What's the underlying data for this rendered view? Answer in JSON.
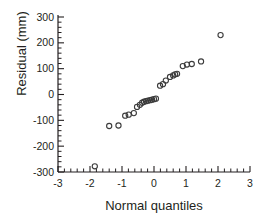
{
  "chart_data": {
    "type": "scatter",
    "title": "",
    "subtitle": "",
    "xlabel": "Normal quantiles",
    "ylabel": "Residual (mm)",
    "xlim": [
      -3,
      3
    ],
    "ylim": [
      -300,
      300
    ],
    "xticks": [
      -3,
      -2,
      -1,
      0,
      1,
      2,
      3
    ],
    "xtick_labels": [
      "-3",
      "-2",
      "-1",
      "0",
      "1",
      "2",
      "3"
    ],
    "yticks": [
      -300,
      -200,
      -100,
      0,
      100,
      200,
      300
    ],
    "ytick_labels": [
      "-300",
      "-200",
      "-100",
      "0",
      "100",
      "200",
      "300"
    ],
    "minor_ticks_per_interval": 4,
    "grid": false,
    "legend": null,
    "marker": "open-circle",
    "marker_color": "#3b3b3b",
    "marker_fill": "none",
    "series": [
      {
        "name": "residuals",
        "x": [
          -1.85,
          -1.4,
          -1.11,
          -0.9,
          -0.79,
          -0.63,
          -0.53,
          -0.44,
          -0.37,
          -0.31,
          -0.25,
          -0.19,
          -0.12,
          -0.06,
          0.0,
          0.06,
          0.19,
          0.28,
          0.37,
          0.5,
          0.6,
          0.66,
          0.72,
          0.9,
          1.03,
          1.18,
          1.47,
          2.08
        ],
        "y": [
          -278,
          -122,
          -120,
          -82,
          -78,
          -72,
          -48,
          -40,
          -32,
          -28,
          -26,
          -24,
          -22,
          -20,
          -18,
          -16,
          34,
          40,
          54,
          68,
          74,
          78,
          80,
          110,
          116,
          118,
          128,
          230
        ]
      }
    ]
  }
}
